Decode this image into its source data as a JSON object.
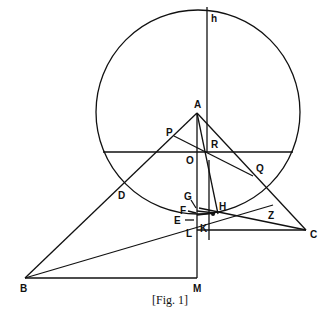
{
  "figure": {
    "caption": "[Fig. 1]",
    "labels": {
      "h": "h",
      "A": "A",
      "P": "P",
      "R": "R",
      "O": "O",
      "Q": "Q",
      "D": "D",
      "G": "G",
      "F": "F",
      "E": "E",
      "H": "H",
      "Z": "Z",
      "K": "K",
      "L": "L",
      "C": "C",
      "B": "B",
      "M": "M"
    }
  }
}
